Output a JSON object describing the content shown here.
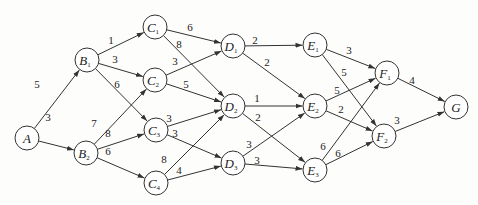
{
  "diagram": {
    "type": "directed-weighted-graph",
    "node_radius": 12,
    "nodes": [
      {
        "id": "A",
        "letter": "A",
        "sub": "",
        "x": 27,
        "y": 138
      },
      {
        "id": "B1",
        "letter": "B",
        "sub": "1",
        "x": 87,
        "y": 60
      },
      {
        "id": "B2",
        "letter": "B",
        "sub": "2",
        "x": 86,
        "y": 153
      },
      {
        "id": "C1",
        "letter": "C",
        "sub": "1",
        "x": 155,
        "y": 27
      },
      {
        "id": "C2",
        "letter": "C",
        "sub": "2",
        "x": 155,
        "y": 80
      },
      {
        "id": "C3",
        "letter": "C",
        "sub": "3",
        "x": 156,
        "y": 130
      },
      {
        "id": "C4",
        "letter": "C",
        "sub": "4",
        "x": 156,
        "y": 183
      },
      {
        "id": "D1",
        "letter": "D",
        "sub": "1",
        "x": 233,
        "y": 46
      },
      {
        "id": "D2",
        "letter": "D",
        "sub": "2",
        "x": 233,
        "y": 106
      },
      {
        "id": "D3",
        "letter": "D",
        "sub": "3",
        "x": 233,
        "y": 163
      },
      {
        "id": "E1",
        "letter": "E",
        "sub": "1",
        "x": 315,
        "y": 45
      },
      {
        "id": "E2",
        "letter": "E",
        "sub": "2",
        "x": 315,
        "y": 106
      },
      {
        "id": "E3",
        "letter": "E",
        "sub": "3",
        "x": 315,
        "y": 170
      },
      {
        "id": "F1",
        "letter": "F",
        "sub": "1",
        "x": 387,
        "y": 73
      },
      {
        "id": "F2",
        "letter": "F",
        "sub": "2",
        "x": 384,
        "y": 136
      },
      {
        "id": "G",
        "letter": "G",
        "sub": "",
        "x": 456,
        "y": 107
      }
    ],
    "edges": [
      {
        "from": "A",
        "to": "B1",
        "weight": "5",
        "lx": 37,
        "ly": 88
      },
      {
        "from": "A",
        "to": "B2",
        "weight": "3",
        "lx": 48,
        "ly": 121
      },
      {
        "from": "B1",
        "to": "C1",
        "weight": "1",
        "lx": 111,
        "ly": 44
      },
      {
        "from": "B1",
        "to": "C2",
        "weight": "3",
        "lx": 115,
        "ly": 63
      },
      {
        "from": "B1",
        "to": "C3",
        "weight": "6",
        "lx": 117,
        "ly": 88
      },
      {
        "from": "B2",
        "to": "C2",
        "weight": "7",
        "lx": 94,
        "ly": 127
      },
      {
        "from": "B2",
        "to": "C3",
        "weight": "8",
        "lx": 108,
        "ly": 137
      },
      {
        "from": "B2",
        "to": "C4",
        "weight": "6",
        "lx": 108,
        "ly": 155
      },
      {
        "from": "C1",
        "to": "D1",
        "weight": "6",
        "lx": 190,
        "ly": 31
      },
      {
        "from": "C1",
        "to": "D2",
        "weight": "8",
        "lx": 179,
        "ly": 48
      },
      {
        "from": "C2",
        "to": "D1",
        "weight": "3",
        "lx": 175,
        "ly": 65
      },
      {
        "from": "C2",
        "to": "D2",
        "weight": "5",
        "lx": 186,
        "ly": 88
      },
      {
        "from": "C3",
        "to": "D2",
        "weight": "3",
        "lx": 169,
        "ly": 122
      },
      {
        "from": "C3",
        "to": "D3",
        "weight": "3",
        "lx": 175,
        "ly": 137
      },
      {
        "from": "C4",
        "to": "D2",
        "weight": "8",
        "lx": 164,
        "ly": 163
      },
      {
        "from": "C4",
        "to": "D3",
        "weight": "4",
        "lx": 179,
        "ly": 174
      },
      {
        "from": "D1",
        "to": "E1",
        "weight": "2",
        "lx": 255,
        "ly": 44
      },
      {
        "from": "D1",
        "to": "E2",
        "weight": "2",
        "lx": 267,
        "ly": 66
      },
      {
        "from": "D2",
        "to": "E2",
        "weight": "1",
        "lx": 257,
        "ly": 102
      },
      {
        "from": "D2",
        "to": "E3",
        "weight": "2",
        "lx": 258,
        "ly": 121
      },
      {
        "from": "D3",
        "to": "E2",
        "weight": "3",
        "lx": 249,
        "ly": 148
      },
      {
        "from": "D3",
        "to": "E3",
        "weight": "3",
        "lx": 257,
        "ly": 164
      },
      {
        "from": "E1",
        "to": "F1",
        "weight": "3",
        "lx": 349,
        "ly": 54
      },
      {
        "from": "E1",
        "to": "F2",
        "weight": "5",
        "lx": 344,
        "ly": 76
      },
      {
        "from": "E2",
        "to": "F1",
        "weight": "5",
        "lx": 337,
        "ly": 94
      },
      {
        "from": "E2",
        "to": "F2",
        "weight": "2",
        "lx": 341,
        "ly": 113
      },
      {
        "from": "E3",
        "to": "F1",
        "weight": "6",
        "lx": 323,
        "ly": 150
      },
      {
        "from": "E3",
        "to": "F2",
        "weight": "6",
        "lx": 338,
        "ly": 157
      },
      {
        "from": "F1",
        "to": "G",
        "weight": "4",
        "lx": 412,
        "ly": 84
      },
      {
        "from": "F2",
        "to": "G",
        "weight": "3",
        "lx": 397,
        "ly": 124
      }
    ]
  }
}
